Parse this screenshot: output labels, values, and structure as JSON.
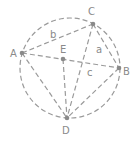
{
  "diagram": {
    "colors": {
      "stroke": "#9a9a9a",
      "point": "#8a8a8a",
      "label": "#8a8a8a",
      "background": "#ffffff"
    },
    "circle": {
      "cx": 70,
      "cy": 68,
      "r": 50
    },
    "points": {
      "A": {
        "label": "A",
        "x": 22,
        "y": 53
      },
      "B": {
        "label": "B",
        "x": 119,
        "y": 68
      },
      "C": {
        "label": "C",
        "x": 93,
        "y": 24
      },
      "D": {
        "label": "D",
        "x": 67,
        "y": 118
      },
      "E": {
        "label": "E",
        "x": 63,
        "y": 59
      }
    },
    "segments": [
      [
        "A",
        "C"
      ],
      [
        "C",
        "B"
      ],
      [
        "A",
        "B"
      ],
      [
        "A",
        "D"
      ],
      [
        "C",
        "D"
      ],
      [
        "B",
        "D"
      ],
      [
        "E",
        "D"
      ]
    ],
    "side_labels": {
      "a": "a",
      "b": "b",
      "c": "c"
    }
  }
}
